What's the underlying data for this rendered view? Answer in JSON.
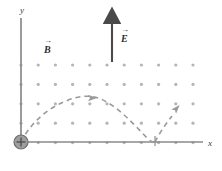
{
  "figure": {
    "width": 222,
    "height": 171,
    "background": "#ffffff"
  },
  "axes": {
    "x_label": "x",
    "y_label": "y",
    "axis_color": "#8a8a8a",
    "origin": {
      "x": 21,
      "y": 142
    },
    "x_axis_end": {
      "x": 205,
      "y": 142
    },
    "y_axis_top": {
      "x": 21,
      "y": 15
    }
  },
  "fields": {
    "magnetic": {
      "label": "B",
      "vector_marker": "→",
      "symbol_name": "B-field-out-of-page",
      "description": "out of page, shown as dot array",
      "dot_color": "#b9b9b9",
      "label_position": {
        "x": 44,
        "y": 50
      }
    },
    "electric": {
      "label": "E",
      "vector_marker": "→",
      "direction": "up",
      "arrow_color": "#4a4a4a",
      "arrow_x": 112,
      "arrow_top_y": 15,
      "arrow_bottom_y": 62,
      "label_position": {
        "x": 120,
        "y": 37
      }
    }
  },
  "dot_grid": {
    "name": "magnetic-field-dot-array",
    "columns": 11,
    "rows": 5,
    "x_start": 21,
    "x_step": 17.2,
    "y_start": 65,
    "y_step": 19.4,
    "dot_radius": 1.6,
    "color": "#b5b5b5"
  },
  "charge": {
    "sign": "+",
    "name": "positive-point-charge",
    "center": {
      "x": 21,
      "y": 142
    },
    "radius": 7,
    "fill": "#9e9e9e",
    "stroke": "#6e6e6e"
  },
  "trajectory": {
    "name": "cycloid-path",
    "style": "dashed",
    "color": "#9a9a9a",
    "dash": "5,4",
    "stroke_width": 1.6,
    "cusp_x": 155,
    "peak_x": 95,
    "peak_y": 98,
    "arrowheads": [
      {
        "x": 93,
        "y": 98,
        "angle": 0,
        "name": "trajectory-arrowhead-apex"
      },
      {
        "x": 177,
        "y": 108,
        "angle": -48,
        "name": "trajectory-arrowhead-second-arc"
      }
    ],
    "path_main": "M 21,142 C 30,124 46,109 66,101 C 80,95 92,95 101,99 C 118,107 132,122 147,138 C 150,141 152,142 155,142",
    "path_second": "M 155,142 C 158,136 164,126 172,116"
  },
  "cusp_marker": {
    "name": "cusp-tick",
    "x": 155,
    "y_top": 136,
    "y_bottom": 146,
    "color": "#8f8f8f"
  }
}
